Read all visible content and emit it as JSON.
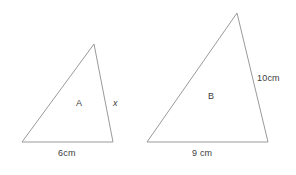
{
  "figure": {
    "background_color": "#ffffff",
    "stroke_color": "#9a9a9a",
    "text_color": "#3d3d3d"
  },
  "shapes": [
    {
      "id": "triangle-a",
      "name": "A",
      "interior_label": "A",
      "points": "22,142 94,44 113,142",
      "labels": {
        "base": "6cm",
        "right_side": "x"
      }
    },
    {
      "id": "triangle-b",
      "name": "B",
      "interior_label": "B",
      "points": "147,142 237,13 268,142",
      "labels": {
        "base": "9 cm",
        "right_side": "10cm"
      }
    }
  ]
}
